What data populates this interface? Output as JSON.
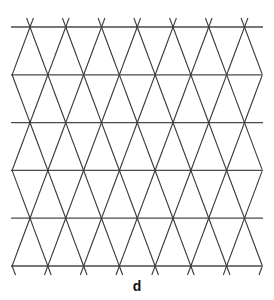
{
  "figure": {
    "caption": "d",
    "horizontal_line_count": 6,
    "nodes_per_row": [
      7,
      8,
      7,
      8,
      7,
      8
    ],
    "line_color": "#3a3a3a",
    "background": "#ffffff"
  }
}
